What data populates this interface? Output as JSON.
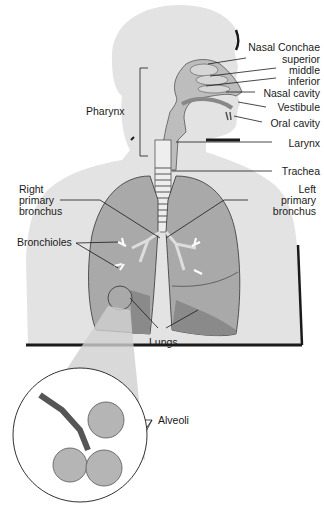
{
  "diagram": {
    "colors": {
      "body": "#e3e3e3",
      "lung": "#a9a9a9",
      "lung_dark": "#8a8a8a",
      "airway": "#bdbdbd",
      "outline": "#1a1a1a",
      "text": "#1a1a1a"
    },
    "labels": {
      "nasal_conchae": "Nasal Conchae",
      "superior": "superior",
      "middle": "middle",
      "inferior": "inferior",
      "nasal_cavity": "Nasal cavity",
      "vestibule": "Vestibule",
      "oral_cavity": "Oral cavity",
      "larynx": "Larynx",
      "trachea": "Trachea",
      "pharynx": "Pharynx",
      "right_primary_bronchus": [
        "Right",
        "primary",
        "bronchus"
      ],
      "left_primary_bronchus": [
        "Left",
        "primary",
        "bronchus"
      ],
      "bronchioles": "Bronchioles",
      "lungs": "Lungs",
      "alveoli": "Alveoli"
    }
  }
}
